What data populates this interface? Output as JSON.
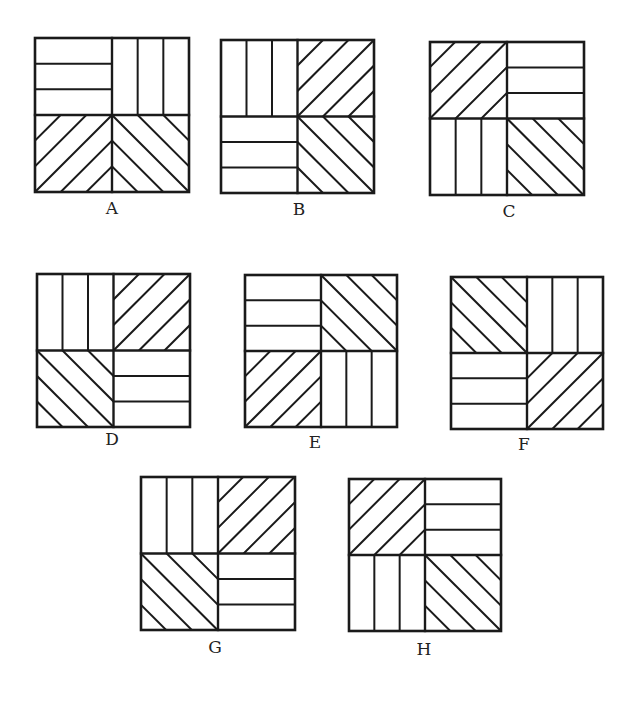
{
  "figures": [
    {
      "label": "A",
      "x": 35,
      "y": 38,
      "w": 154,
      "h": 154,
      "lx": 112,
      "ly": 208,
      "quadrants": [
        "h",
        "v",
        "d1",
        "d2"
      ]
    },
    {
      "label": "B",
      "x": 221,
      "y": 40,
      "w": 153,
      "h": 153,
      "lx": 299,
      "ly": 209,
      "quadrants": [
        "v",
        "d1",
        "h",
        "d2"
      ]
    },
    {
      "label": "C",
      "x": 430,
      "y": 42,
      "w": 154,
      "h": 153,
      "lx": 509,
      "ly": 211,
      "quadrants": [
        "d1",
        "h",
        "v",
        "d2"
      ]
    },
    {
      "label": "D",
      "x": 37,
      "y": 274,
      "w": 153,
      "h": 153,
      "lx": 112,
      "ly": 439,
      "quadrants": [
        "v",
        "d1",
        "d2",
        "h"
      ]
    },
    {
      "label": "E",
      "x": 245,
      "y": 275,
      "w": 152,
      "h": 152,
      "lx": 315,
      "ly": 442,
      "quadrants": [
        "h",
        "d2",
        "d1",
        "v"
      ]
    },
    {
      "label": "F",
      "x": 451,
      "y": 277,
      "w": 152,
      "h": 152,
      "lx": 524,
      "ly": 444,
      "quadrants": [
        "d2",
        "v",
        "h",
        "d1"
      ]
    },
    {
      "label": "G",
      "x": 141,
      "y": 477,
      "w": 154,
      "h": 153,
      "lx": 215,
      "ly": 647,
      "quadrants": [
        "v",
        "d1",
        "d2",
        "h"
      ]
    },
    {
      "label": "H",
      "x": 349,
      "y": 479,
      "w": 152,
      "h": 152,
      "lx": 424,
      "ly": 649,
      "quadrants": [
        "d1",
        "h",
        "v",
        "d2"
      ]
    }
  ],
  "colors": {
    "line": "#1a1a1a",
    "background": "#ffffff"
  }
}
